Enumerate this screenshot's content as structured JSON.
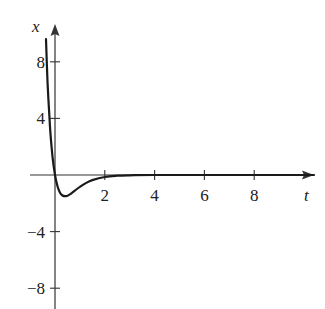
{
  "chart_data": {
    "type": "line",
    "title": "",
    "xlabel": "t",
    "ylabel": "x",
    "xlim": [
      -0.4,
      10.4
    ],
    "ylim": [
      -9.5,
      10.5
    ],
    "grid": false,
    "legend": null,
    "x_ticks": [
      2,
      4,
      6,
      8
    ],
    "x_tick_labels": [
      "2",
      "4",
      "6",
      "8"
    ],
    "y_ticks": [
      8,
      4,
      -4,
      -8
    ],
    "y_tick_labels": [
      "8",
      "4",
      "−4",
      "−8"
    ],
    "series": [
      {
        "name": "x(t)",
        "x": [
          -0.36,
          -0.3,
          -0.2,
          -0.1,
          0,
          0.1,
          0.2,
          0.3,
          0.4,
          0.5,
          0.6,
          0.8,
          1.0,
          1.2,
          1.5,
          2.0,
          2.5,
          3.0,
          4.0,
          6.0,
          8.0,
          10.4
        ],
        "values": [
          9.6,
          6.6,
          3.4,
          1.3,
          0,
          -0.8,
          -1.25,
          -1.45,
          -1.5,
          -1.46,
          -1.37,
          -1.1,
          -0.84,
          -0.61,
          -0.36,
          -0.14,
          -0.05,
          -0.02,
          0,
          0,
          0,
          0
        ]
      }
    ]
  },
  "axes": {
    "x_label": "t",
    "y_label": "x"
  },
  "colors": {
    "axis": "#333333",
    "curve": "#1a1a1a",
    "text": "#222222"
  }
}
